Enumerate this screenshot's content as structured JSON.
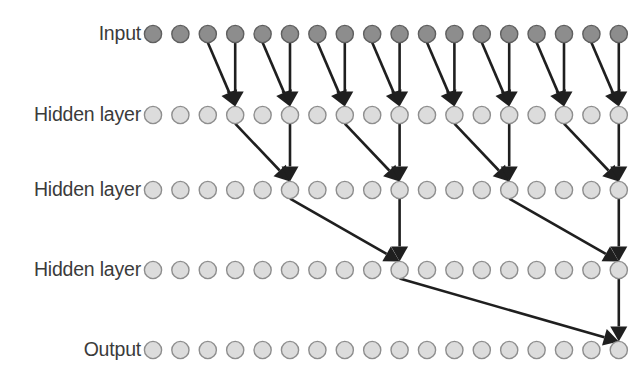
{
  "diagram": {
    "type": "neural-network",
    "canvas": {
      "width": 644,
      "height": 387,
      "background": "#ffffff"
    },
    "colors": {
      "input_node_fill": "#8d8d8d",
      "input_node_stroke": "#5f5f5f",
      "hidden_node_fill": "#dcdcdc",
      "hidden_node_stroke": "#8e8e8e",
      "output_node_fill": "#dcdcdc",
      "output_node_stroke": "#8e8e8e",
      "edge_color": "#1f1f1f",
      "label_color": "#3b3b3b"
    },
    "geometry": {
      "node_radius": 8.6,
      "first_node_x": 153,
      "node_spacing": 27.4,
      "nodes_per_layer": 18,
      "label_right_x": 141
    },
    "layers": [
      {
        "id": "input",
        "label": "Input",
        "y": 34,
        "node_count": 18,
        "node_style": "input",
        "label_text": "Input"
      },
      {
        "id": "hidden1",
        "label": "Hidden layer",
        "y": 115,
        "node_count": 18,
        "node_style": "hidden",
        "label_text": "Hidden layer"
      },
      {
        "id": "hidden2",
        "label": "Hidden layer",
        "y": 190,
        "node_count": 18,
        "node_style": "hidden",
        "label_text": "Hidden layer"
      },
      {
        "id": "hidden3",
        "label": "Hidden layer",
        "y": 270,
        "node_count": 18,
        "node_style": "hidden",
        "label_text": "Hidden layer"
      },
      {
        "id": "output",
        "label": "Output",
        "y": 350,
        "node_count": 18,
        "node_style": "output",
        "label_text": "Output"
      }
    ],
    "edges": [
      {
        "from_layer": 0,
        "from_index": 2,
        "to_layer": 1,
        "to_index": 3
      },
      {
        "from_layer": 0,
        "from_index": 3,
        "to_layer": 1,
        "to_index": 3
      },
      {
        "from_layer": 0,
        "from_index": 4,
        "to_layer": 1,
        "to_index": 5
      },
      {
        "from_layer": 0,
        "from_index": 5,
        "to_layer": 1,
        "to_index": 5
      },
      {
        "from_layer": 0,
        "from_index": 6,
        "to_layer": 1,
        "to_index": 7
      },
      {
        "from_layer": 0,
        "from_index": 7,
        "to_layer": 1,
        "to_index": 7
      },
      {
        "from_layer": 0,
        "from_index": 8,
        "to_layer": 1,
        "to_index": 9
      },
      {
        "from_layer": 0,
        "from_index": 9,
        "to_layer": 1,
        "to_index": 9
      },
      {
        "from_layer": 0,
        "from_index": 10,
        "to_layer": 1,
        "to_index": 11
      },
      {
        "from_layer": 0,
        "from_index": 11,
        "to_layer": 1,
        "to_index": 11
      },
      {
        "from_layer": 0,
        "from_index": 12,
        "to_layer": 1,
        "to_index": 13
      },
      {
        "from_layer": 0,
        "from_index": 13,
        "to_layer": 1,
        "to_index": 13
      },
      {
        "from_layer": 0,
        "from_index": 14,
        "to_layer": 1,
        "to_index": 15
      },
      {
        "from_layer": 0,
        "from_index": 15,
        "to_layer": 1,
        "to_index": 15
      },
      {
        "from_layer": 0,
        "from_index": 16,
        "to_layer": 1,
        "to_index": 17
      },
      {
        "from_layer": 0,
        "from_index": 17,
        "to_layer": 1,
        "to_index": 17
      },
      {
        "from_layer": 1,
        "from_index": 3,
        "to_layer": 2,
        "to_index": 5
      },
      {
        "from_layer": 1,
        "from_index": 5,
        "to_layer": 2,
        "to_index": 5
      },
      {
        "from_layer": 1,
        "from_index": 7,
        "to_layer": 2,
        "to_index": 9
      },
      {
        "from_layer": 1,
        "from_index": 9,
        "to_layer": 2,
        "to_index": 9
      },
      {
        "from_layer": 1,
        "from_index": 11,
        "to_layer": 2,
        "to_index": 13
      },
      {
        "from_layer": 1,
        "from_index": 13,
        "to_layer": 2,
        "to_index": 13
      },
      {
        "from_layer": 1,
        "from_index": 15,
        "to_layer": 2,
        "to_index": 17
      },
      {
        "from_layer": 1,
        "from_index": 17,
        "to_layer": 2,
        "to_index": 17
      },
      {
        "from_layer": 2,
        "from_index": 5,
        "to_layer": 3,
        "to_index": 9
      },
      {
        "from_layer": 2,
        "from_index": 9,
        "to_layer": 3,
        "to_index": 9
      },
      {
        "from_layer": 2,
        "from_index": 13,
        "to_layer": 3,
        "to_index": 17
      },
      {
        "from_layer": 2,
        "from_index": 17,
        "to_layer": 3,
        "to_index": 17
      },
      {
        "from_layer": 3,
        "from_index": 9,
        "to_layer": 4,
        "to_index": 17
      },
      {
        "from_layer": 3,
        "from_index": 17,
        "to_layer": 4,
        "to_index": 17
      }
    ]
  }
}
